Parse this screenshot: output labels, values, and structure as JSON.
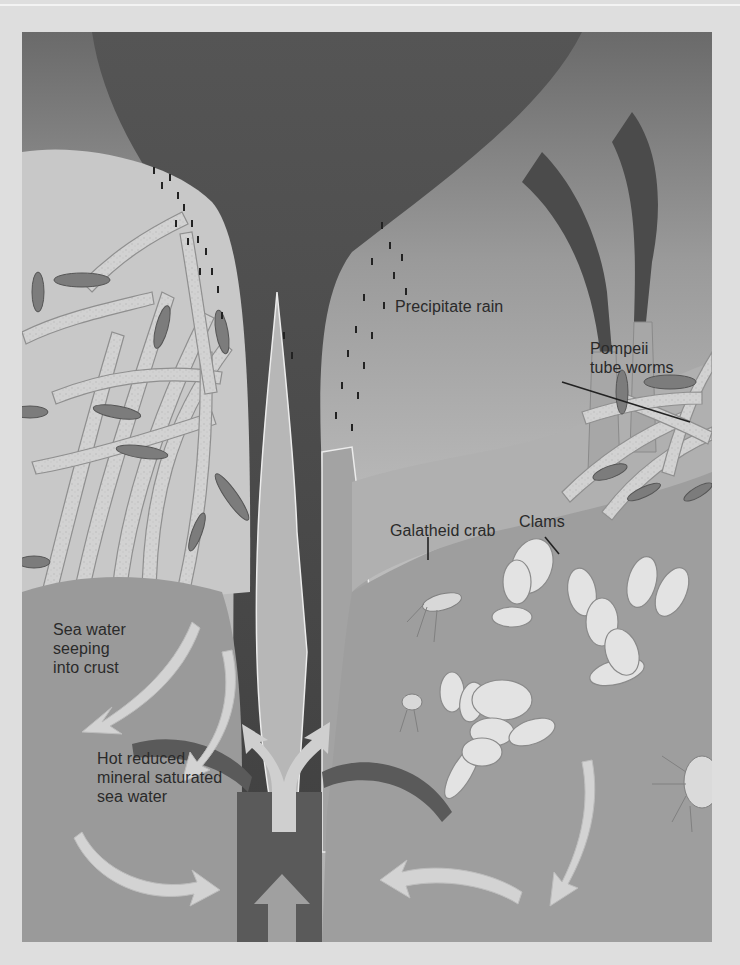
{
  "diagram": {
    "colors": {
      "page_background": "#dedede",
      "water_top": "#6e6e6e",
      "water_light": "#b9b9b9",
      "plume": "#4a4a4a",
      "chimney_wall": "#a6a6a6",
      "seafloor": "#9c9c9c",
      "crust_channel": "#585858",
      "tube_worm": "#d4d4d4",
      "worm_plume": "#7a7a7a",
      "clam": "#e2e2e2",
      "arrow": "#cfcfcf",
      "label_text": "#2a2a2a"
    },
    "labels": {
      "precipitate_rain": "Precipitate rain",
      "pompeii_tube_worms": "Pompeii\ntube worms",
      "galatheid_crab": "Galatheid crab",
      "clams": "Clams",
      "sea_water_seeping": "Sea water\nseeping\ninto crust",
      "hot_reduced_water": "Hot reduced\nmineral saturated\nsea water"
    },
    "icons": {
      "flow_arrows": "curved-arrow",
      "upflow_arrows": "up-arrow",
      "split_arrow": "y-split-arrow"
    }
  }
}
